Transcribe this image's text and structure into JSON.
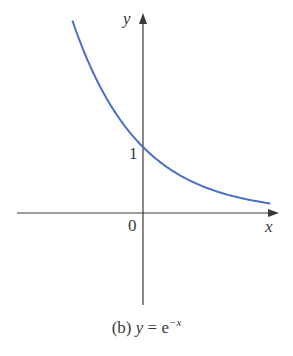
{
  "chart_data": {
    "type": "line",
    "caption_prefix": "(b) ",
    "caption_var": "y",
    "caption_eq": " = e",
    "caption_exp": "−x",
    "xlabel": "x",
    "ylabel": "y",
    "tick_labels": {
      "origin": "0",
      "y_one": "1"
    },
    "function": "e^(-x)",
    "x_range": [
      -1.07,
      1.93
    ],
    "series": [
      {
        "name": "y = e^(-x)",
        "x": [
          -1.07,
          -0.75,
          -0.5,
          -0.25,
          0,
          0.25,
          0.5,
          0.75,
          1,
          1.25,
          1.5,
          1.75,
          1.93
        ],
        "values": [
          2.92,
          2.12,
          1.65,
          1.28,
          1.0,
          0.78,
          0.61,
          0.47,
          0.37,
          0.29,
          0.22,
          0.17,
          0.15
        ]
      }
    ],
    "colors": {
      "curve": "#4a6fc4",
      "axes": "#3a3a3a"
    },
    "grid": false
  }
}
